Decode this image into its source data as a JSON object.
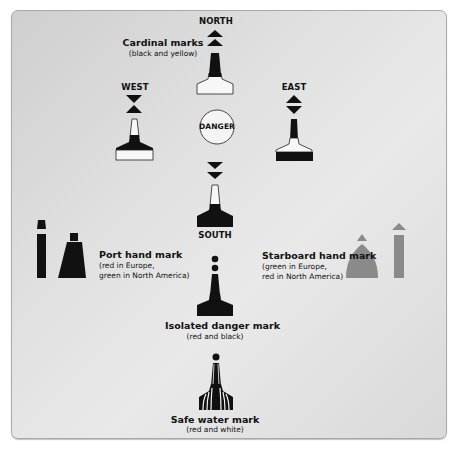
{
  "diagram": {
    "title": "Cardinal marks",
    "subtitle": "(black and yellow)",
    "directions": {
      "north": "NORTH",
      "south": "SOUTH",
      "east": "EAST",
      "west": "WEST"
    },
    "center_label": "DANGER",
    "port": {
      "title": "Port hand mark",
      "line1": "(red in Europe,",
      "line2": "green in North America)"
    },
    "starboard": {
      "title": "Starboard hand mark",
      "line1": "(green in Europe,",
      "line2": "red in North America)"
    },
    "isolated": {
      "title": "Isolated danger mark",
      "sub": "(red and black)"
    },
    "safe_water": {
      "title": "Safe water mark",
      "sub": "(red and white)"
    },
    "colors": {
      "panel_bg": "#e2e2e2",
      "black": "#111111",
      "white": "#f7f7f7",
      "starboard_gray": "#8a8a8a"
    }
  }
}
